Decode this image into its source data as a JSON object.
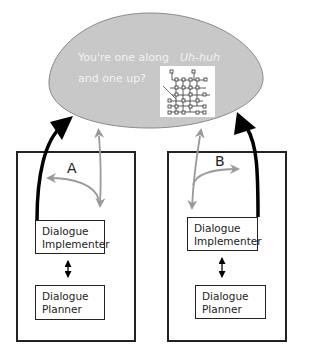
{
  "bubble": {
    "line1": "You're one along",
    "line2": "and one up?",
    "reply": "Uh-huh",
    "fill": "#c8c8c8",
    "text_color": "#f2f2f2",
    "figure": "network-diagram-thumbnail"
  },
  "agents": [
    {
      "label": "A",
      "implementer": "Dialogue Implementer",
      "implementer_lines": [
        "Dialogue",
        "Implementer"
      ],
      "planner_lines": [
        "Dialogue",
        "Planner"
      ]
    },
    {
      "label": "B",
      "implementer": "Dialogue Implementer",
      "implementer_lines": [
        "Dialogue",
        "Implementer"
      ],
      "planner_lines": [
        "Dialogue",
        "Planner"
      ]
    }
  ],
  "colors": {
    "black_arrow": "#000000",
    "gray_arrow": "#9a9a9a",
    "box_stroke": "#222222"
  }
}
